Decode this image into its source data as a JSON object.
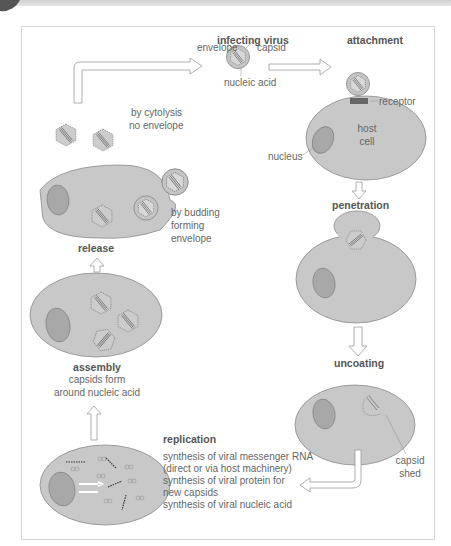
{
  "stages": {
    "infecting_virus": {
      "title": "infecting virus",
      "labels": {
        "envelope": "envelope",
        "capsid": "capsid",
        "nucleic_acid": "nucleic acid"
      }
    },
    "attachment": {
      "title": "attachment",
      "labels": {
        "receptor": "receptor",
        "host_cell_line1": "host",
        "host_cell_line2": "cell",
        "nucleus": "nucleus"
      }
    },
    "penetration": {
      "title": "penetration"
    },
    "uncoating": {
      "title": "uncoating",
      "labels": {
        "capsid_shed_line1": "capsid",
        "capsid_shed_line2": "shed"
      }
    },
    "replication": {
      "title": "replication",
      "lines": [
        "synthesis of viral messenger RNA",
        "(direct or via host machinery)",
        "synthesis of viral protein for",
        "new capsids",
        "synthesis of viral nucleic acid"
      ]
    },
    "assembly": {
      "title": "assembly",
      "lines": [
        "capsids form",
        "around nucleic acid"
      ]
    },
    "release": {
      "title": "release",
      "cytolysis": [
        "by cytolysis",
        "no envelope"
      ],
      "budding": [
        "by budding",
        "forming",
        "envelope"
      ]
    }
  },
  "colors": {
    "cell_fill": "#c8c8c8",
    "cell_stroke": "#8a8a8a",
    "nucleus_fill": "#a8a8a8",
    "receptor": "#666666",
    "arrow_stroke": "#9a9a9a",
    "frame_border": "#d6d6d6"
  }
}
